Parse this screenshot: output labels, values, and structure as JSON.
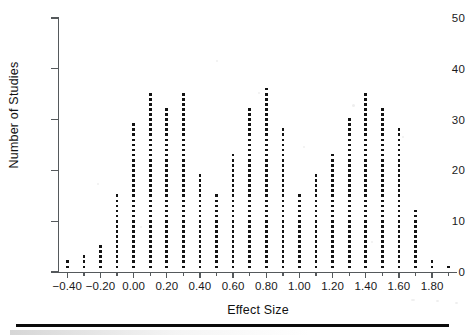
{
  "figure": {
    "background_color": "#ffffff",
    "ink_color": "#131313",
    "axis_color": "#55595c"
  },
  "chart_data": {
    "type": "scatter",
    "plot_style": "dot-plot-histogram",
    "title": "",
    "subtitle": "",
    "xlabel": "Effect Size",
    "ylabel": "Number of Studies",
    "xlim": [
      -0.45,
      1.95
    ],
    "ylim": [
      0,
      50
    ],
    "grid": false,
    "legend": null,
    "x_tick_labels": [
      "−0.40",
      "−0.20",
      "0.00",
      "0.20",
      "0.40",
      "0.60",
      "0.80",
      "1.00",
      "1.20",
      "1.40",
      "1.60",
      "1.80"
    ],
    "x_tick_values": [
      -0.4,
      -0.2,
      0.0,
      0.2,
      0.4,
      0.6,
      0.8,
      1.0,
      1.2,
      1.4,
      1.6,
      1.8
    ],
    "y_tick_labels": [
      "0",
      "10",
      "20",
      "30",
      "40",
      "50"
    ],
    "y_tick_values": [
      0,
      10,
      20,
      30,
      40,
      50
    ],
    "bin_width": 0.1,
    "categories": [
      -0.4,
      -0.3,
      -0.2,
      -0.1,
      0.0,
      0.1,
      0.2,
      0.3,
      0.4,
      0.5,
      0.6,
      0.7,
      0.8,
      0.9,
      1.0,
      1.1,
      1.2,
      1.3,
      1.4,
      1.5,
      1.6,
      1.7,
      1.8,
      1.9
    ],
    "values": [
      2,
      3,
      5,
      15,
      29,
      35,
      32,
      35,
      19,
      15,
      23,
      32,
      36,
      28,
      15,
      19,
      23,
      30,
      35,
      32,
      28,
      12,
      2,
      1
    ]
  }
}
